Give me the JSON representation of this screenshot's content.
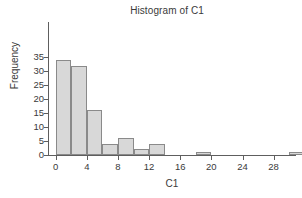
{
  "chart_data": {
    "type": "bar",
    "title": "Histogram of C1",
    "xlabel": "C1",
    "ylabel": "Frequency",
    "bin_width": 2,
    "bin_starts": [
      0,
      2,
      4,
      6,
      8,
      10,
      12,
      14,
      16,
      18,
      20,
      22,
      24,
      26,
      28,
      30
    ],
    "categories": [
      "0-2",
      "2-4",
      "4-6",
      "6-8",
      "8-10",
      "10-12",
      "12-14",
      "14-16",
      "16-18",
      "18-20",
      "20-22",
      "22-24",
      "24-26",
      "26-28",
      "28-30",
      "30-32"
    ],
    "values": [
      34,
      32,
      16,
      4,
      6,
      2,
      4,
      0,
      0,
      1,
      0,
      0,
      0,
      0,
      0,
      1
    ],
    "xlim": [
      -1,
      32
    ],
    "ylim": [
      0,
      36
    ],
    "xticks": [
      0,
      4,
      8,
      12,
      16,
      20,
      24,
      28
    ],
    "yticks": [
      0,
      5,
      10,
      15,
      20,
      25,
      30,
      35
    ],
    "xtick_labels": [
      "0",
      "4",
      "8",
      "12",
      "16",
      "20",
      "24",
      "28"
    ],
    "ytick_labels": [
      "0",
      "5",
      "10",
      "15",
      "20",
      "25",
      "30",
      "35"
    ],
    "grid": false,
    "legend": false,
    "bar_fill_color": "#d8d8d8",
    "bar_border_color": "#8a8a8a",
    "axis_color": "#5e5e5e",
    "text_color": "#3a3a3a",
    "background_color": "#ffffff"
  }
}
